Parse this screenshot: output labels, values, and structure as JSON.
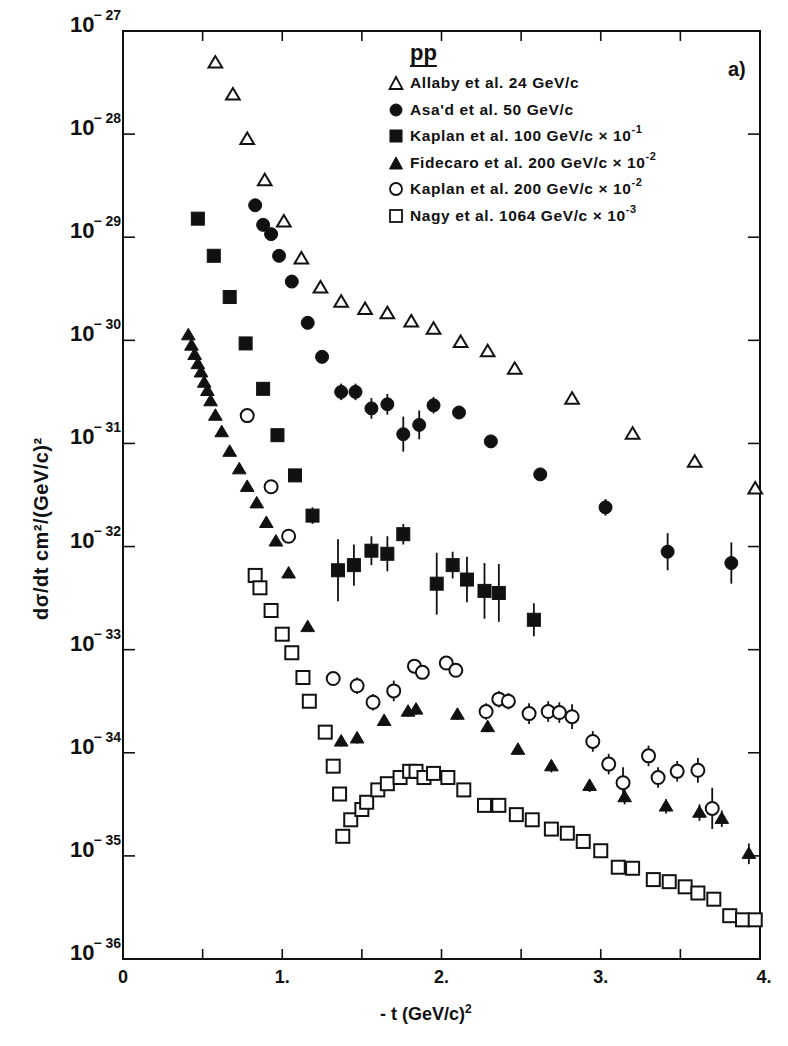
{
  "chart_data": {
    "type": "scatter",
    "title": "",
    "panel_label": "a)",
    "reaction": "pp",
    "xlabel": "- t  (GeV/c)",
    "xlabel_sup": "2",
    "ylabel": "dσ/dt cm²/(GeV/c)²",
    "xlim": [
      0,
      4
    ],
    "ylim_log10": [
      -36,
      -27
    ],
    "yscale": "log",
    "grid": false,
    "legend_position": "upper right",
    "x_ticks": [
      {
        "value": 0,
        "label": "0"
      },
      {
        "value": 0.5,
        "label": ""
      },
      {
        "value": 1,
        "label": "1."
      },
      {
        "value": 1.5,
        "label": ""
      },
      {
        "value": 2,
        "label": "2."
      },
      {
        "value": 2.5,
        "label": ""
      },
      {
        "value": 3,
        "label": "3."
      },
      {
        "value": 3.5,
        "label": ""
      },
      {
        "value": 4,
        "label": "4."
      }
    ],
    "y_ticks": [
      {
        "exp": -27,
        "base": "10",
        "sup": "-27"
      },
      {
        "exp": -28,
        "base": "10",
        "sup": "-28"
      },
      {
        "exp": -29,
        "base": "10",
        "sup": "-29"
      },
      {
        "exp": -30,
        "base": "10",
        "sup": "-30"
      },
      {
        "exp": -31,
        "base": "10",
        "sup": "-31"
      },
      {
        "exp": -32,
        "base": "10",
        "sup": "-32"
      },
      {
        "exp": -33,
        "base": "10",
        "sup": "-33"
      },
      {
        "exp": -34,
        "base": "10",
        "sup": "-34"
      },
      {
        "exp": -35,
        "base": "10",
        "sup": "-35"
      },
      {
        "exp": -36,
        "base": "10",
        "sup": "-36"
      }
    ],
    "series": [
      {
        "name": "Allaby et al. 24 GeV/c",
        "label_text": "Allaby  et  al. 24 GeV/c",
        "scale_sup": "",
        "marker": "triangle-open",
        "t": [
          0.58,
          0.69,
          0.78,
          0.89,
          1.01,
          1.12,
          1.24,
          1.37,
          1.52,
          1.66,
          1.81,
          1.95,
          2.12,
          2.29,
          2.46,
          2.82,
          3.2,
          3.59,
          3.97
        ],
        "log10_dsdt": [
          -27.31,
          -27.62,
          -28.05,
          -28.45,
          -28.85,
          -29.21,
          -29.49,
          -29.63,
          -29.7,
          -29.74,
          -29.82,
          -29.89,
          -30.02,
          -30.11,
          -30.28,
          -30.57,
          -30.91,
          -31.18,
          -31.44
        ],
        "err_log10": [
          0,
          0,
          0,
          0,
          0,
          0,
          0,
          0,
          0,
          0,
          0,
          0,
          0,
          0,
          0,
          0,
          0,
          0,
          0
        ]
      },
      {
        "name": "Asa'd et al. 50 GeV/c",
        "label_text": "Asa'd  et  al.  50  GeV/c",
        "scale_sup": "",
        "marker": "circle-filled",
        "t": [
          0.83,
          0.88,
          0.93,
          0.98,
          1.06,
          1.16,
          1.25,
          1.37,
          1.46,
          1.56,
          1.66,
          1.76,
          1.86,
          1.95,
          2.11,
          2.31,
          2.62,
          3.03,
          3.42,
          3.82
        ],
        "log10_dsdt": [
          -28.69,
          -28.88,
          -28.97,
          -29.18,
          -29.43,
          -29.83,
          -30.16,
          -30.5,
          -30.5,
          -30.66,
          -30.62,
          -30.91,
          -30.82,
          -30.63,
          -30.7,
          -30.98,
          -31.3,
          -31.62,
          -32.05,
          -32.16
        ],
        "err_log10": [
          0,
          0,
          0,
          0,
          0,
          0,
          0.05,
          0.08,
          0.08,
          0.1,
          0.1,
          0.17,
          0.14,
          0.08,
          0,
          0.05,
          0.05,
          0.08,
          0.18,
          0.2
        ]
      },
      {
        "name": "Kaplan et al. 100 GeV/c x 10^-1",
        "label_text": "Kaplan   et  al. 100  GeV/c  × 10",
        "scale_sup": "-1",
        "marker": "square-filled",
        "t": [
          0.47,
          0.57,
          0.67,
          0.77,
          0.88,
          0.97,
          1.08,
          1.19,
          1.35,
          1.45,
          1.56,
          1.66,
          1.76,
          1.97,
          2.07,
          2.16,
          2.27,
          2.36,
          2.58
        ],
        "log10_dsdt": [
          -28.82,
          -29.18,
          -29.58,
          -30.03,
          -30.47,
          -30.92,
          -31.31,
          -31.7,
          -32.23,
          -32.18,
          -32.04,
          -32.07,
          -31.88,
          -32.36,
          -32.18,
          -32.32,
          -32.43,
          -32.45,
          -32.71
        ],
        "err_log10": [
          0,
          0,
          0,
          0,
          0,
          0,
          0.04,
          0.08,
          0.3,
          0.2,
          0.14,
          0.17,
          0.1,
          0.3,
          0.13,
          0.22,
          0.27,
          0.28,
          0.16
        ]
      },
      {
        "name": "Fidecaro et al. 200 GeV/c x 10^-2",
        "label_text": "Fidecaro   et  al.  200 GeV/c × 10",
        "scale_sup": "-2",
        "marker": "triangle-filled",
        "t": [
          0.41,
          0.43,
          0.45,
          0.47,
          0.49,
          0.51,
          0.53,
          0.55,
          0.58,
          0.62,
          0.67,
          0.73,
          0.78,
          0.84,
          0.9,
          0.96,
          1.04,
          1.16,
          1.37,
          1.47,
          1.64,
          1.79,
          1.84,
          2.1,
          2.29,
          2.48,
          2.69,
          2.93,
          3.15,
          3.41,
          3.62,
          3.76,
          3.93
        ],
        "log10_dsdt": [
          -29.95,
          -30.05,
          -30.14,
          -30.23,
          -30.31,
          -30.41,
          -30.49,
          -30.59,
          -30.73,
          -30.89,
          -31.08,
          -31.25,
          -31.42,
          -31.58,
          -31.77,
          -31.95,
          -32.26,
          -32.78,
          -33.89,
          -33.86,
          -33.69,
          -33.6,
          -33.58,
          -33.63,
          -33.75,
          -33.97,
          -34.13,
          -34.32,
          -34.43,
          -34.52,
          -34.58,
          -34.64,
          -34.98
        ],
        "err_log10": [
          0,
          0,
          0,
          0,
          0,
          0,
          0,
          0,
          0,
          0,
          0,
          0,
          0,
          0,
          0,
          0,
          0,
          0,
          0.05,
          0.05,
          0.05,
          0.05,
          0.05,
          0.05,
          0.05,
          0.05,
          0.06,
          0.06,
          0.07,
          0.07,
          0.08,
          0.08,
          0.1
        ]
      },
      {
        "name": "Kaplan et al. 200 GeV/c x 10^-2",
        "label_text": "Kaplan   et  al.  200 GeV/c × 10",
        "scale_sup": "-2",
        "marker": "circle-open",
        "t": [
          0.78,
          0.93,
          1.04,
          1.32,
          1.47,
          1.57,
          1.7,
          1.83,
          1.88,
          2.03,
          2.09,
          2.28,
          2.36,
          2.42,
          2.55,
          2.67,
          2.74,
          2.82,
          2.95,
          3.05,
          3.14,
          3.3,
          3.36,
          3.48,
          3.61,
          3.7
        ],
        "log10_dsdt": [
          -30.73,
          -31.42,
          -31.9,
          -33.28,
          -33.35,
          -33.51,
          -33.4,
          -33.16,
          -33.22,
          -33.13,
          -33.2,
          -33.6,
          -33.48,
          -33.5,
          -33.62,
          -33.6,
          -33.61,
          -33.65,
          -33.89,
          -34.11,
          -34.29,
          -34.03,
          -34.24,
          -34.18,
          -34.17,
          -34.54
        ],
        "err_log10": [
          0,
          0,
          0,
          0.05,
          0.08,
          0.08,
          0.1,
          0.05,
          0.05,
          0.05,
          0.06,
          0.08,
          0.08,
          0.08,
          0.1,
          0.1,
          0.1,
          0.12,
          0.1,
          0.1,
          0.15,
          0.1,
          0.1,
          0.1,
          0.12,
          0.2
        ]
      },
      {
        "name": "Nagy et al. 1064 GeV/c x 10^-3",
        "label_text": "Nagy   et   al.  1064 GeV/c × 10",
        "scale_sup": "-3",
        "marker": "square-open",
        "t": [
          0.83,
          0.86,
          0.93,
          1.0,
          1.06,
          1.13,
          1.17,
          1.27,
          1.32,
          1.36,
          1.38,
          1.43,
          1.5,
          1.53,
          1.6,
          1.66,
          1.74,
          1.8,
          1.84,
          1.89,
          1.95,
          2.04,
          2.14,
          2.27,
          2.36,
          2.47,
          2.57,
          2.69,
          2.79,
          2.89,
          3.0,
          3.11,
          3.2,
          3.33,
          3.43,
          3.53,
          3.61,
          3.71,
          3.81,
          3.89,
          3.97
        ],
        "log10_dsdt": [
          -32.28,
          -32.4,
          -32.62,
          -32.85,
          -33.03,
          -33.27,
          -33.5,
          -33.8,
          -34.13,
          -34.4,
          -34.81,
          -34.65,
          -34.55,
          -34.48,
          -34.36,
          -34.3,
          -34.24,
          -34.18,
          -34.18,
          -34.24,
          -34.2,
          -34.24,
          -34.36,
          -34.51,
          -34.51,
          -34.6,
          -34.65,
          -34.74,
          -34.78,
          -34.86,
          -34.95,
          -35.11,
          -35.12,
          -35.23,
          -35.25,
          -35.3,
          -35.36,
          -35.42,
          -35.58,
          -35.62,
          -35.62
        ],
        "err_log10": []
      }
    ]
  }
}
